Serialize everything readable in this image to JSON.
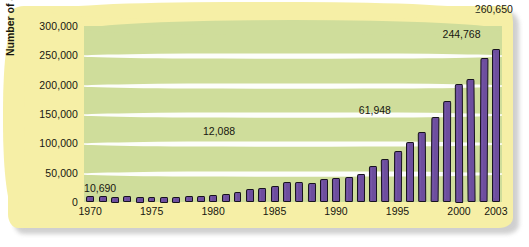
{
  "chart_data": {
    "type": "bar",
    "title": "",
    "xlabel": "",
    "ylabel": "Number of accounts",
    "ylim": [
      0,
      300000
    ],
    "ytick_values": [
      0,
      50000,
      100000,
      150000,
      200000,
      250000,
      300000
    ],
    "ytick_labels": [
      "0",
      "50,000",
      "100,000",
      "150,000",
      "200,000",
      "250,000",
      "300,000"
    ],
    "xtick_labels": [
      "1970",
      "1975",
      "1980",
      "1985",
      "1990",
      "1995",
      "2000",
      "2003"
    ],
    "grid": true,
    "legend": false,
    "bar_color": "#6d4e9e",
    "plot_background": "#cfdd9b",
    "panel_background": "#f6efa6",
    "categories": [
      "1970",
      "1971",
      "1972",
      "1973",
      "1974",
      "1975",
      "1976",
      "1977",
      "1978",
      "1979",
      "1980",
      "1981",
      "1982",
      "1983",
      "1984",
      "1985",
      "1986",
      "1987",
      "1988",
      "1989",
      "1990",
      "1991",
      "1992",
      "1993",
      "1994",
      "1995",
      "1996",
      "1997",
      "1998",
      "1999",
      "2000",
      "2001",
      "2002",
      "2003"
    ],
    "values": [
      10690,
      9800,
      9200,
      9600,
      8900,
      9100,
      9400,
      8700,
      9900,
      10400,
      12088,
      13500,
      17500,
      21500,
      24000,
      27500,
      33500,
      34500,
      32500,
      38500,
      41000,
      43000,
      47000,
      61948,
      74000,
      87000,
      102000,
      120000,
      145000,
      172000,
      202000,
      210000,
      244768,
      260650
    ],
    "annotations": [
      {
        "category": "1970",
        "label": "10,690"
      },
      {
        "category": "1980",
        "label": "12,088"
      },
      {
        "category": "1993",
        "label": "61,948"
      },
      {
        "category": "2002",
        "label": "244,768"
      },
      {
        "category": "2003",
        "label": "260,650"
      }
    ]
  }
}
